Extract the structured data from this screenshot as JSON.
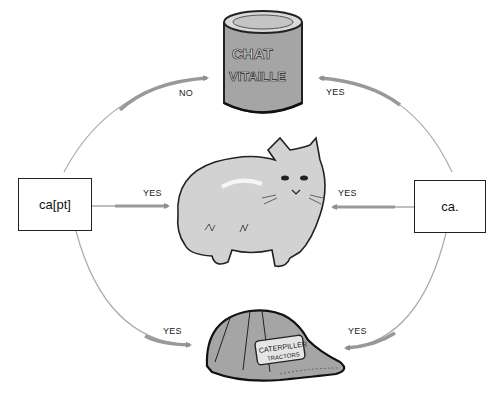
{
  "diagram": {
    "nodes": {
      "left_box": {
        "label": "ca[pt]"
      },
      "right_box": {
        "label": "ca."
      },
      "can": {
        "label_line1": "CHAT",
        "label_line2": "VITAILLE",
        "icon": "pet-food-can-icon"
      },
      "cat": {
        "icon": "cat-illustration"
      },
      "cap": {
        "label_line1": "CATERPILLER",
        "label_line2": "TRACTORS",
        "icon": "baseball-cap-icon"
      }
    },
    "edges": [
      {
        "from": "ca[pt]",
        "to": "can",
        "label": "NO"
      },
      {
        "from": "ca.",
        "to": "can",
        "label": "YES"
      },
      {
        "from": "ca[pt]",
        "to": "cat",
        "label": "YES"
      },
      {
        "from": "ca.",
        "to": "cat",
        "label": "YES"
      },
      {
        "from": "ca[pt]",
        "to": "cap",
        "label": "YES"
      },
      {
        "from": "ca.",
        "to": "cap",
        "label": "YES"
      }
    ],
    "colors": {
      "arrow": "#9a9a9a",
      "box_border": "#222222",
      "illustration_fill": "#a8a8a8"
    }
  }
}
